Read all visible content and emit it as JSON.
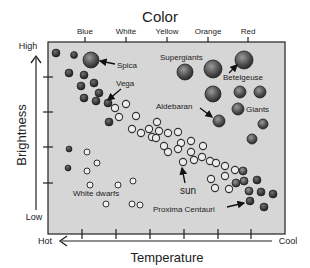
{
  "chart_data": {
    "type": "scatter",
    "title": "Color",
    "xlabel": "Temperature",
    "ylabel": "Brightness",
    "x_axis_ends": {
      "left": "Hot",
      "right": "Cool"
    },
    "y_axis_ends": {
      "top": "High",
      "bottom": "Low"
    },
    "color_ticks": [
      "Blue",
      "White",
      "Yellow",
      "Orange",
      "Red"
    ],
    "background_color": "#d6d6d6",
    "annotations": [
      {
        "label": "Spica",
        "name": "annotation-spica"
      },
      {
        "label": "Vega",
        "name": "annotation-vega"
      },
      {
        "label": "Supergiants",
        "name": "annotation-supergiants"
      },
      {
        "label": "Betelgeuse",
        "name": "annotation-betelgeuse"
      },
      {
        "label": "Aldebaran",
        "name": "annotation-aldebaran"
      },
      {
        "label": "Giants",
        "name": "annotation-giants"
      },
      {
        "label": "sun",
        "name": "annotation-sun"
      },
      {
        "label": "White dwarfs",
        "name": "annotation-white-dwarfs"
      },
      {
        "label": "Proxima Centauri",
        "name": "annotation-proxima-centauri"
      }
    ],
    "groups": {
      "main_sequence_dark": "filled dark circles, hot bright and cool dim ends of main sequence",
      "main_sequence_open": "open circles, middle of main sequence",
      "giants": "large shaded spheres",
      "white_dwarfs": "small open circles, hot and dim"
    }
  }
}
